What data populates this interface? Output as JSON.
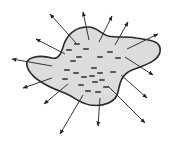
{
  "diagram": {
    "title": "",
    "colors": {
      "fill": "#dcdcdc",
      "outline": "#2a2a2a",
      "arrow": "#333333",
      "charge": "#1e1e1e",
      "background": "#ffffff"
    },
    "blob_path": "M27,66 C24,58 38,54 52,58 C60,60 62,50 64,44 C68,34 76,27 88,27 C98,27 100,34 108,36 C118,38 126,36 136,38 C148,40 162,40 160,52 C158,62 142,66 132,70 C122,74 120,82 118,92 C116,102 104,107 90,105 C78,103 74,96 62,92 C46,86 30,78 27,66 Z",
    "charges": [
      {
        "x": 77,
        "y": 44
      },
      {
        "x": 86,
        "y": 49
      },
      {
        "x": 69,
        "y": 50
      },
      {
        "x": 110,
        "y": 52
      },
      {
        "x": 79,
        "y": 57
      },
      {
        "x": 100,
        "y": 57
      },
      {
        "x": 118,
        "y": 58
      },
      {
        "x": 73,
        "y": 61
      },
      {
        "x": 67,
        "y": 70
      },
      {
        "x": 94,
        "y": 68
      },
      {
        "x": 76,
        "y": 73
      },
      {
        "x": 100,
        "y": 73
      },
      {
        "x": 113,
        "y": 72
      },
      {
        "x": 92,
        "y": 76
      },
      {
        "x": 65,
        "y": 79
      },
      {
        "x": 84,
        "y": 77
      },
      {
        "x": 102,
        "y": 80
      },
      {
        "x": 81,
        "y": 85
      },
      {
        "x": 95,
        "y": 82
      },
      {
        "x": 106,
        "y": 87
      },
      {
        "x": 88,
        "y": 91
      },
      {
        "x": 98,
        "y": 92
      }
    ],
    "charge_sign": "-",
    "arrows": [
      {
        "x1": 89,
        "y1": 40,
        "x2": 83,
        "y2": 12
      },
      {
        "x1": 76,
        "y1": 43,
        "x2": 50,
        "y2": 14
      },
      {
        "x1": 99,
        "y1": 42,
        "x2": 112,
        "y2": 16
      },
      {
        "x1": 115,
        "y1": 45,
        "x2": 128,
        "y2": 22
      },
      {
        "x1": 127,
        "y1": 49,
        "x2": 158,
        "y2": 34
      },
      {
        "x1": 125,
        "y1": 57,
        "x2": 153,
        "y2": 75
      },
      {
        "x1": 121,
        "y1": 75,
        "x2": 147,
        "y2": 98
      },
      {
        "x1": 108,
        "y1": 86,
        "x2": 145,
        "y2": 123
      },
      {
        "x1": 100,
        "y1": 98,
        "x2": 98,
        "y2": 126
      },
      {
        "x1": 83,
        "y1": 95,
        "x2": 60,
        "y2": 134
      },
      {
        "x1": 68,
        "y1": 84,
        "x2": 44,
        "y2": 104
      },
      {
        "x1": 52,
        "y1": 78,
        "x2": 23,
        "y2": 88
      },
      {
        "x1": 52,
        "y1": 66,
        "x2": 12,
        "y2": 59
      },
      {
        "x1": 65,
        "y1": 54,
        "x2": 36,
        "y2": 39
      }
    ]
  }
}
